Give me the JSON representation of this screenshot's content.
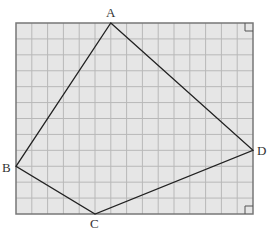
{
  "diagram": {
    "grid": {
      "cols": 15,
      "rows": 12,
      "fill": "#e6e6e6",
      "line_color": "#b8b8b8",
      "border_color": "#777777"
    },
    "rect": {
      "x": 16,
      "y": 23,
      "width": 237,
      "height": 191
    },
    "vertices": [
      {
        "name": "A",
        "grid": [
          6,
          0
        ]
      },
      {
        "name": "D",
        "grid": [
          15,
          8
        ]
      },
      {
        "name": "C",
        "grid": [
          5,
          12
        ]
      },
      {
        "name": "B",
        "grid": [
          0,
          9
        ]
      }
    ],
    "labels": {
      "A": "A",
      "B": "B",
      "C": "C",
      "D": "D"
    },
    "right_angle_marks": [
      "top-right",
      "bottom-right"
    ],
    "line_color": "#222222"
  }
}
